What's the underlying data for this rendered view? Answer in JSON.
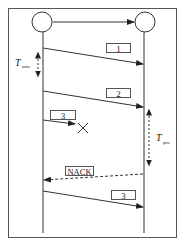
{
  "diagram": {
    "type": "sequence",
    "colors": {
      "line": "#333333",
      "frame": "#555555",
      "background": "#ffffff"
    },
    "nodes": [
      {
        "id": "sender",
        "label": ""
      },
      {
        "id": "receiver",
        "label": ""
      }
    ],
    "messages": [
      {
        "id": "msg1",
        "label": "1",
        "from": "sender",
        "to": "receiver",
        "style": "solid",
        "delivered": true
      },
      {
        "id": "msg2",
        "label": "2",
        "from": "sender",
        "to": "receiver",
        "style": "solid",
        "delivered": true
      },
      {
        "id": "msg3-lost",
        "label": "3",
        "from": "sender",
        "to": "receiver",
        "style": "solid",
        "delivered": false,
        "marker": "X"
      },
      {
        "id": "nack",
        "label": "NACK",
        "from": "receiver",
        "to": "sender",
        "style": "dashed",
        "delivered": true
      },
      {
        "id": "msg3-retx",
        "label": "3",
        "from": "sender",
        "to": "receiver",
        "style": "solid",
        "delivered": true
      }
    ],
    "intervals": [
      {
        "id": "t-min",
        "symbol": "T",
        "subscript": "min",
        "side": "sender"
      },
      {
        "id": "t-pro",
        "symbol": "T",
        "subscript": "pro",
        "side": "receiver"
      }
    ]
  }
}
